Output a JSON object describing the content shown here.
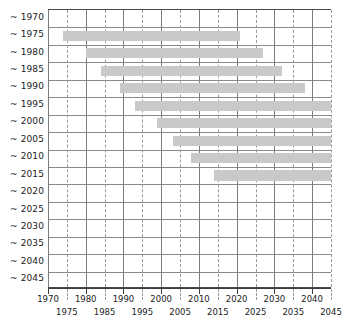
{
  "chart_data": {
    "type": "bar",
    "orientation": "horizontal-gantt",
    "title": "",
    "subtitle": "",
    "xlabel": "",
    "ylabel": "",
    "xlim": [
      1970,
      2045
    ],
    "grid": true,
    "legend": null,
    "bar_color": "#c9c9c9",
    "categories": [
      "~ 1970",
      "~ 1975",
      "~ 1980",
      "~ 1985",
      "~ 1990",
      "~ 1995",
      "~ 2000",
      "~ 2005",
      "~ 2010",
      "~ 2015",
      "~ 2020",
      "~ 2025",
      "~ 2030",
      "~ 2035",
      "~ 2040",
      "~ 2045"
    ],
    "x_major_ticks": [
      1970,
      1980,
      1990,
      2000,
      2010,
      2020,
      2030,
      2040
    ],
    "x_minor_ticks": [
      1975,
      1985,
      1995,
      2005,
      2015,
      2025,
      2035,
      2045
    ],
    "x_all_ticks": [
      1970,
      1975,
      1980,
      1985,
      1990,
      1995,
      2000,
      2005,
      2010,
      2015,
      2020,
      2025,
      2030,
      2035,
      2040,
      2045
    ],
    "bars": [
      {
        "category": "~ 1970",
        "start": null,
        "end": null,
        "visible": false
      },
      {
        "category": "~ 1975",
        "start": 1974,
        "end": 2021,
        "visible": true
      },
      {
        "category": "~ 1980",
        "start": 1980,
        "end": 2027,
        "visible": true
      },
      {
        "category": "~ 1985",
        "start": 1984,
        "end": 2032,
        "visible": true
      },
      {
        "category": "~ 1990",
        "start": 1989,
        "end": 2038,
        "visible": true
      },
      {
        "category": "~ 1995",
        "start": 1993,
        "end": 2045,
        "visible": true
      },
      {
        "category": "~ 2000",
        "start": 1999,
        "end": 2045,
        "visible": true
      },
      {
        "category": "~ 2005",
        "start": 2003,
        "end": 2045,
        "visible": true
      },
      {
        "category": "~ 2010",
        "start": 2008,
        "end": 2045,
        "visible": true
      },
      {
        "category": "~ 2015",
        "start": 2014,
        "end": 2045,
        "visible": true
      },
      {
        "category": "~ 2020",
        "start": null,
        "end": null,
        "visible": false
      },
      {
        "category": "~ 2025",
        "start": null,
        "end": null,
        "visible": false
      },
      {
        "category": "~ 2030",
        "start": null,
        "end": null,
        "visible": false
      },
      {
        "category": "~ 2035",
        "start": null,
        "end": null,
        "visible": false
      },
      {
        "category": "~ 2040",
        "start": null,
        "end": null,
        "visible": false
      },
      {
        "category": "~ 2045",
        "start": null,
        "end": null,
        "visible": false
      }
    ]
  }
}
